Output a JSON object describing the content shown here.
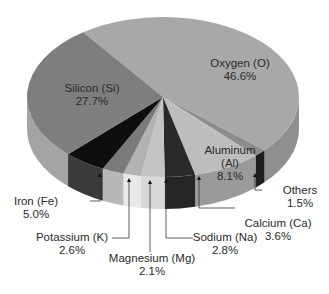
{
  "chart_data": {
    "type": "pie",
    "title": "",
    "style": "3d",
    "start_angle_deg": -126,
    "direction": "clockwise",
    "slices": [
      {
        "label": "Oxygen (O)",
        "value": 46.6,
        "value_label": "46.6%",
        "top": "#a8a8a8",
        "side": "#8f8f8f"
      },
      {
        "label": "Others",
        "value": 1.5,
        "value_label": "1.5%",
        "top": "#8c8c8c",
        "side": "#1e1e1e"
      },
      {
        "label": "Aluminum (Al)",
        "value": 8.1,
        "value_label": "8.1%",
        "top": "#bdbdbd",
        "side": "#9a9a9a"
      },
      {
        "label": "Calcium (Ca)",
        "value": 3.6,
        "value_label": "3.6%",
        "top": "#2a2a2a",
        "side": "#262626"
      },
      {
        "label": "Sodium (Na)",
        "value": 2.8,
        "value_label": "2.8%",
        "top": "#c4c4c4",
        "side": "#d8d8d8"
      },
      {
        "label": "Magnesium (Mg)",
        "value": 2.1,
        "value_label": "2.1%",
        "top": "#b2b2b2",
        "side": "#e8e8e8"
      },
      {
        "label": "Potassium (K)",
        "value": 2.6,
        "value_label": "2.6%",
        "top": "#7a7a7a",
        "side": "#b8b8b8"
      },
      {
        "label": "Iron (Fe)",
        "value": 5.0,
        "value_label": "5.0%",
        "top": "#0e0e0e",
        "side": "#3a3a3a"
      },
      {
        "label": "Silicon (Si)",
        "value": 27.7,
        "value_label": "27.7%",
        "top": "#7e7e7e",
        "side": "#a4a4a4"
      }
    ]
  },
  "labels": {
    "oxygen": {
      "name": "Oxygen (O)",
      "pct": "46.6%"
    },
    "silicon": {
      "name": "Silicon (Si)",
      "pct": "27.7%"
    },
    "aluminum": {
      "name1": "Aluminum",
      "name2": "(Al)",
      "pct": "8.1%"
    },
    "others": {
      "name": "Others",
      "pct": "1.5%"
    },
    "calcium": {
      "name": "Calcium (Ca)",
      "pct": "3.6%"
    },
    "sodium": {
      "name": "Sodium (Na)",
      "pct": "2.8%"
    },
    "magnesium": {
      "name": "Magnesium (Mg)",
      "pct": "2.1%"
    },
    "potassium": {
      "name": "Potassium (K)",
      "pct": "2.6%"
    },
    "iron": {
      "name": "Iron (Fe)",
      "pct": "5.0%"
    }
  }
}
